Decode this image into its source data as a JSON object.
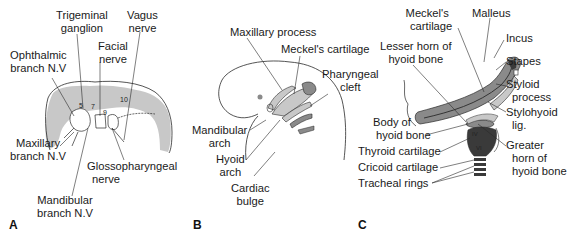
{
  "panels": {
    "A": {
      "letter": "A",
      "labels": {
        "trigeminal_1": "Trigeminal",
        "trigeminal_2": "ganglion",
        "vagus_1": "Vagus",
        "vagus_2": "nerve",
        "facial_1": "Facial",
        "facial_2": "nerve",
        "ophthalmic_1": "Ophthalmic",
        "ophthalmic_2": "branch N.V",
        "maxillary_1": "Maxillary",
        "maxillary_2": "branch N.V",
        "glosso_1": "Glossopharyngeal",
        "glosso_2": "nerve",
        "mandibular_1": "Mandibular",
        "mandibular_2": "branch N.V"
      },
      "numbers": {
        "n5": "5",
        "n7": "7",
        "n9": "9",
        "n10": "10"
      }
    },
    "B": {
      "letter": "B",
      "labels": {
        "maxillary_process": "Maxillary process",
        "meckels_cartilage": "Meckel's cartilage",
        "pharyngeal_1": "Pharyngeal",
        "pharyngeal_2": "cleft",
        "mandibular_1": "Mandibular",
        "mandibular_2": "arch",
        "hyoid_1": "Hyoid",
        "hyoid_2": "arch",
        "cardiac_1": "Cardiac",
        "cardiac_2": "bulge"
      }
    },
    "C": {
      "letter": "C",
      "labels": {
        "meckels_1": "Meckel's",
        "meckels_2": "cartilage",
        "malleus": "Malleus",
        "incus": "Incus",
        "stapes": "Stapes",
        "lesser_1": "Lesser horn of",
        "lesser_2": "hyoid bone",
        "styloid_1": "Styloid",
        "styloid_2": "process",
        "stylohyoid_1": "Stylohyoid",
        "stylohyoid_2": "lig.",
        "body_1": "Body of",
        "body_2": "hyoid bone",
        "thyroid": "Thyroid cartilage",
        "cricoid": "Cricoid cartilage",
        "tracheal": "Tracheal rings",
        "greater_1": "Greater",
        "greater_2": "horn of",
        "greater_3": "hyoid bone"
      },
      "numbers": {
        "iv": "IV",
        "vi": "VI"
      }
    }
  },
  "colors": {
    "shade": "#c8c8c8",
    "dark_shade": "#8a8a8a",
    "cartilage_dark": "#3a3a3a",
    "line": "#2a2a2a"
  }
}
